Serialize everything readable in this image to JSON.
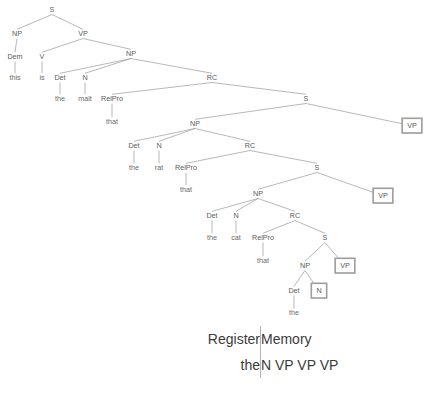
{
  "figure": {
    "sentence_fragment": "this is the malt that the rat that the cat that the ...",
    "colors": {
      "edge": "#9a9a9a",
      "label": "#5a5a5a",
      "box_border": "#9d9d9d",
      "box_fill": "#ffffff",
      "table_text": "#3c3c3c",
      "table_divider": "#b4b4b4",
      "background": "#ffffff"
    }
  },
  "tree": {
    "nodes": [
      {
        "id": "n01",
        "label": "S",
        "x": 52,
        "y": 12,
        "kind": "nonterminal",
        "boxed": false
      },
      {
        "id": "n02",
        "label": "NP",
        "x": 17,
        "y": 36,
        "kind": "nonterminal",
        "boxed": false
      },
      {
        "id": "n03",
        "label": "VP",
        "x": 83,
        "y": 36,
        "kind": "nonterminal",
        "boxed": false
      },
      {
        "id": "n04",
        "label": "Dem",
        "x": 15,
        "y": 59,
        "kind": "preterminal",
        "boxed": false
      },
      {
        "id": "n05",
        "label": "this",
        "x": 15,
        "y": 80,
        "kind": "terminal",
        "boxed": false
      },
      {
        "id": "n06",
        "label": "V",
        "x": 42,
        "y": 59,
        "kind": "preterminal",
        "boxed": false
      },
      {
        "id": "n07",
        "label": "is",
        "x": 42,
        "y": 80,
        "kind": "terminal",
        "boxed": false
      },
      {
        "id": "n08",
        "label": "NP",
        "x": 131,
        "y": 56,
        "kind": "nonterminal",
        "boxed": false
      },
      {
        "id": "n09",
        "label": "Det",
        "x": 60,
        "y": 80,
        "kind": "preterminal",
        "boxed": false
      },
      {
        "id": "n10",
        "label": "the",
        "x": 60,
        "y": 101,
        "kind": "terminal",
        "boxed": false
      },
      {
        "id": "n11",
        "label": "N",
        "x": 85,
        "y": 80,
        "kind": "preterminal",
        "boxed": false
      },
      {
        "id": "n12",
        "label": "malt",
        "x": 85,
        "y": 101,
        "kind": "terminal",
        "boxed": false
      },
      {
        "id": "n13",
        "label": "RC",
        "x": 212,
        "y": 80,
        "kind": "nonterminal",
        "boxed": false
      },
      {
        "id": "n14",
        "label": "RelPro",
        "x": 112,
        "y": 101,
        "kind": "preterminal",
        "boxed": false
      },
      {
        "id": "n15",
        "label": "that",
        "x": 112,
        "y": 124,
        "kind": "terminal",
        "boxed": false
      },
      {
        "id": "n16",
        "label": "S",
        "x": 306,
        "y": 101,
        "kind": "nonterminal",
        "boxed": false
      },
      {
        "id": "n17",
        "label": "NP",
        "x": 195,
        "y": 126,
        "kind": "nonterminal",
        "boxed": false
      },
      {
        "id": "n18",
        "label": "VP",
        "x": 412,
        "y": 128,
        "kind": "nonterminal",
        "boxed": true
      },
      {
        "id": "n19",
        "label": "Det",
        "x": 134,
        "y": 148,
        "kind": "preterminal",
        "boxed": false
      },
      {
        "id": "n20",
        "label": "the",
        "x": 134,
        "y": 170,
        "kind": "terminal",
        "boxed": false
      },
      {
        "id": "n21",
        "label": "N",
        "x": 159,
        "y": 148,
        "kind": "preterminal",
        "boxed": false
      },
      {
        "id": "n22",
        "label": "rat",
        "x": 159,
        "y": 170,
        "kind": "terminal",
        "boxed": false
      },
      {
        "id": "n23",
        "label": "RC",
        "x": 250,
        "y": 148,
        "kind": "nonterminal",
        "boxed": false
      },
      {
        "id": "n24",
        "label": "RelPro",
        "x": 186,
        "y": 170,
        "kind": "preterminal",
        "boxed": false
      },
      {
        "id": "n25",
        "label": "that",
        "x": 186,
        "y": 192,
        "kind": "terminal",
        "boxed": false
      },
      {
        "id": "n26",
        "label": "S",
        "x": 317,
        "y": 170,
        "kind": "nonterminal",
        "boxed": false
      },
      {
        "id": "n27",
        "label": "NP",
        "x": 258,
        "y": 196,
        "kind": "nonterminal",
        "boxed": false
      },
      {
        "id": "n28",
        "label": "VP",
        "x": 383,
        "y": 198,
        "kind": "nonterminal",
        "boxed": true
      },
      {
        "id": "n29",
        "label": "Det",
        "x": 212,
        "y": 218,
        "kind": "preterminal",
        "boxed": false
      },
      {
        "id": "n30",
        "label": "the",
        "x": 212,
        "y": 240,
        "kind": "terminal",
        "boxed": false
      },
      {
        "id": "n31",
        "label": "N",
        "x": 236,
        "y": 218,
        "kind": "preterminal",
        "boxed": false
      },
      {
        "id": "n32",
        "label": "cat",
        "x": 236,
        "y": 240,
        "kind": "terminal",
        "boxed": false
      },
      {
        "id": "n33",
        "label": "RC",
        "x": 295,
        "y": 218,
        "kind": "nonterminal",
        "boxed": false
      },
      {
        "id": "n34",
        "label": "RelPro",
        "x": 263,
        "y": 240,
        "kind": "preterminal",
        "boxed": false
      },
      {
        "id": "n35",
        "label": "that",
        "x": 263,
        "y": 263,
        "kind": "terminal",
        "boxed": false
      },
      {
        "id": "n36",
        "label": "S",
        "x": 325,
        "y": 240,
        "kind": "nonterminal",
        "boxed": false
      },
      {
        "id": "n37",
        "label": "NP",
        "x": 305,
        "y": 268,
        "kind": "nonterminal",
        "boxed": false
      },
      {
        "id": "n38",
        "label": "VP",
        "x": 345,
        "y": 268,
        "kind": "nonterminal",
        "boxed": true
      },
      {
        "id": "n39",
        "label": "Det",
        "x": 294,
        "y": 293,
        "kind": "preterminal",
        "boxed": false
      },
      {
        "id": "n40",
        "label": "the",
        "x": 294,
        "y": 315,
        "kind": "terminal",
        "boxed": false
      },
      {
        "id": "n41",
        "label": "N",
        "x": 319,
        "y": 293,
        "kind": "preterminal",
        "boxed": true
      }
    ],
    "edges": [
      [
        "n01",
        "n02"
      ],
      [
        "n01",
        "n03"
      ],
      [
        "n02",
        "n04"
      ],
      [
        "n04",
        "n05"
      ],
      [
        "n03",
        "n06"
      ],
      [
        "n06",
        "n07"
      ],
      [
        "n03",
        "n08"
      ],
      [
        "n08",
        "n09"
      ],
      [
        "n09",
        "n10"
      ],
      [
        "n08",
        "n11"
      ],
      [
        "n11",
        "n12"
      ],
      [
        "n08",
        "n13"
      ],
      [
        "n13",
        "n14"
      ],
      [
        "n14",
        "n15"
      ],
      [
        "n13",
        "n16"
      ],
      [
        "n16",
        "n17"
      ],
      [
        "n16",
        "n18"
      ],
      [
        "n17",
        "n19"
      ],
      [
        "n19",
        "n20"
      ],
      [
        "n17",
        "n21"
      ],
      [
        "n21",
        "n22"
      ],
      [
        "n17",
        "n23"
      ],
      [
        "n23",
        "n24"
      ],
      [
        "n24",
        "n25"
      ],
      [
        "n23",
        "n26"
      ],
      [
        "n26",
        "n27"
      ],
      [
        "n26",
        "n28"
      ],
      [
        "n27",
        "n29"
      ],
      [
        "n29",
        "n30"
      ],
      [
        "n27",
        "n31"
      ],
      [
        "n31",
        "n32"
      ],
      [
        "n27",
        "n33"
      ],
      [
        "n33",
        "n34"
      ],
      [
        "n34",
        "n35"
      ],
      [
        "n33",
        "n36"
      ],
      [
        "n36",
        "n37"
      ],
      [
        "n36",
        "n38"
      ],
      [
        "n37",
        "n39"
      ],
      [
        "n39",
        "n40"
      ],
      [
        "n37",
        "n41"
      ]
    ]
  },
  "register_table": {
    "headers": {
      "register": "Register",
      "memory": "Memory"
    },
    "row": {
      "register": "the",
      "memory": "N VP VP VP"
    }
  }
}
